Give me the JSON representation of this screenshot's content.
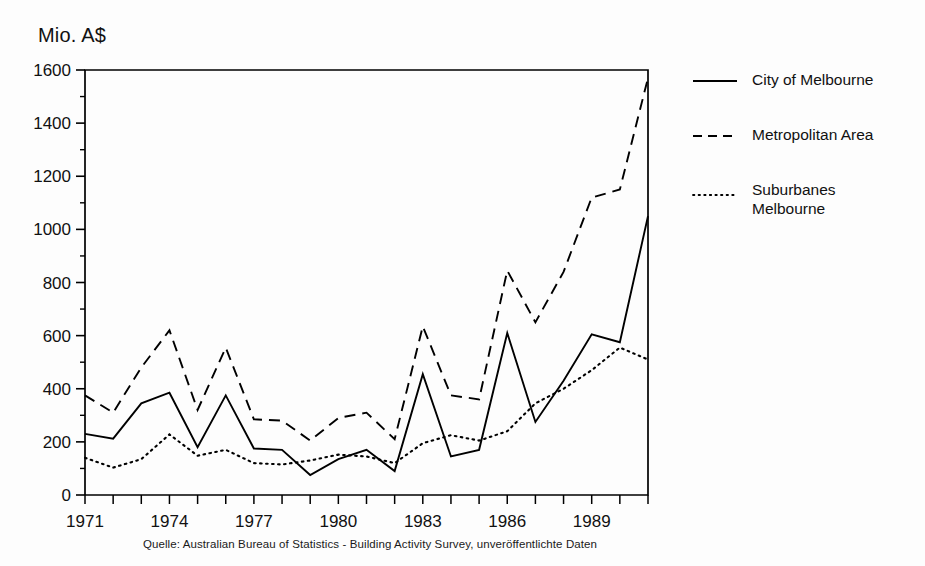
{
  "axis": {
    "y_title": "Mio. A$",
    "y_ticks": [
      "0",
      "200",
      "400",
      "600",
      "800",
      "1000",
      "1200",
      "1400",
      "1600"
    ],
    "x_ticks": [
      "1971",
      "1974",
      "1977",
      "1980",
      "1983",
      "1986",
      "1989"
    ]
  },
  "legend": {
    "items": [
      {
        "label": "City of Melbourne",
        "style": "solid",
        "name": "legend-item-city-of-melbourne"
      },
      {
        "label": "Metropolitan Area",
        "style": "dashed",
        "name": "legend-item-metropolitan-area"
      },
      {
        "label": "Suburbanes\nMelbourne",
        "style": "dotted",
        "name": "legend-item-suburbanes-melbourne"
      }
    ]
  },
  "caption": {
    "text": "Quelle: Australian Bureau of Statistics - Building Activity Survey, unveröffentlichte Daten"
  },
  "colors": {
    "line": "#000000",
    "axis": "#000000",
    "background": "#fdfdfd"
  },
  "chart_data": {
    "type": "line",
    "title": "",
    "xlabel": "",
    "ylabel": "Mio. A$",
    "ylim": [
      0,
      1600
    ],
    "xlim": [
      1971,
      1991
    ],
    "grid": false,
    "legend_position": "right",
    "x": [
      1971,
      1972,
      1973,
      1974,
      1975,
      1976,
      1977,
      1978,
      1979,
      1980,
      1981,
      1982,
      1983,
      1984,
      1985,
      1986,
      1987,
      1988,
      1989,
      1990,
      1991
    ],
    "categories": [
      "1971",
      "1972",
      "1973",
      "1974",
      "1975",
      "1976",
      "1977",
      "1978",
      "1979",
      "1980",
      "1981",
      "1982",
      "1983",
      "1984",
      "1985",
      "1986",
      "1987",
      "1988",
      "1989",
      "1990",
      "1991"
    ],
    "series": [
      {
        "name": "City of Melbourne",
        "style": "solid",
        "values": [
          230,
          212,
          345,
          385,
          180,
          375,
          175,
          170,
          75,
          135,
          170,
          90,
          455,
          145,
          170,
          610,
          275,
          430,
          605,
          575,
          1050
        ]
      },
      {
        "name": "Metropolitan Area",
        "style": "dashed",
        "values": [
          375,
          310,
          480,
          620,
          320,
          555,
          285,
          280,
          205,
          290,
          310,
          210,
          635,
          375,
          360,
          845,
          650,
          840,
          1120,
          1150,
          1570
        ]
      },
      {
        "name": "Suburbanes Melbourne",
        "style": "dotted",
        "values": [
          140,
          103,
          135,
          228,
          148,
          170,
          120,
          115,
          130,
          152,
          145,
          120,
          195,
          225,
          205,
          240,
          345,
          400,
          470,
          555,
          510
        ]
      }
    ]
  }
}
